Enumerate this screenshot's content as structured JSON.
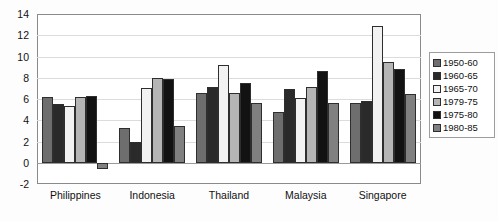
{
  "chart_data": {
    "type": "bar",
    "title": "",
    "subtitle": "",
    "xlabel": "",
    "ylabel": "",
    "ylim": [
      -2,
      14
    ],
    "ytick_step": 2,
    "yticks": [
      "14",
      "12",
      "10",
      "8",
      "6",
      "4",
      "2",
      "0",
      "-2"
    ],
    "grid": true,
    "legend_position": "right",
    "categories": [
      "Philippines",
      "Indonesia",
      "Thailand",
      "Malaysia",
      "Singapore"
    ],
    "series": [
      {
        "name": "1950-60",
        "color": "#6e6e6e",
        "values": [
          6.2,
          3.3,
          6.6,
          4.8,
          5.6
        ]
      },
      {
        "name": "1960-65",
        "color": "#2a2a2a",
        "values": [
          5.5,
          2.0,
          7.1,
          6.9,
          5.8
        ]
      },
      {
        "name": "1965-70",
        "color": "#f2f2f2",
        "values": [
          5.3,
          7.0,
          9.2,
          6.1,
          12.9
        ]
      },
      {
        "name": "1979-75",
        "color": "#b5b5b5",
        "values": [
          6.2,
          8.0,
          6.6,
          7.1,
          9.5
        ]
      },
      {
        "name": "1975-80",
        "color": "#121212",
        "values": [
          6.3,
          7.9,
          7.5,
          8.6,
          8.8
        ]
      },
      {
        "name": "1980-85",
        "color": "#808080",
        "values": [
          -0.6,
          3.5,
          5.6,
          5.6,
          6.5
        ]
      }
    ]
  }
}
